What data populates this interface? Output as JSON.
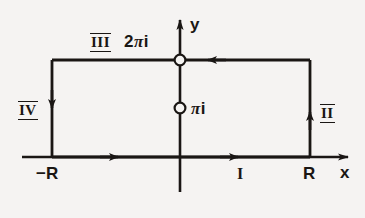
{
  "figure": {
    "background_color": "#f5f3f2",
    "ink_color": "#1a1614",
    "axes": {
      "x_label": "x",
      "y_label": "y",
      "origin_px": [
        180,
        157
      ],
      "x_axis_span_px": [
        22,
        352
      ],
      "y_axis_span_px": [
        16,
        192
      ]
    },
    "contour": {
      "shape": "rectangle",
      "corners_px": {
        "top_left": [
          52,
          60
        ],
        "top_right": [
          310,
          60
        ],
        "bottom_right": [
          310,
          157
        ],
        "bottom_left": [
          52,
          157
        ]
      },
      "orientation": "counterclockwise"
    },
    "segment_labels": [
      {
        "name": "segment-I",
        "text": "I",
        "style": "plain",
        "left_px": 237,
        "top_px": 166
      },
      {
        "name": "segment-II",
        "text": "II",
        "style": "barred",
        "left_px": 320,
        "top_px": 104
      },
      {
        "name": "segment-III",
        "text": "III",
        "style": "barred",
        "left_px": 90,
        "top_px": 33
      },
      {
        "name": "segment-IV",
        "text": "IV",
        "style": "barred",
        "left_px": 18,
        "top_px": 101
      }
    ],
    "points": [
      {
        "name": "point-two-pi-i",
        "label_prefix": "2",
        "label_pi": "π",
        "label_suffix": "i",
        "marker": "open-circle",
        "position_px": [
          180,
          60
        ],
        "label_left_px": 124,
        "label_top_px": 33
      },
      {
        "name": "point-pi-i",
        "label_prefix": "",
        "label_pi": "π",
        "label_suffix": "i",
        "marker": "open-circle",
        "position_px": [
          180,
          108
        ],
        "label_left_px": 191,
        "label_top_px": 100
      }
    ],
    "axis_ticks": [
      {
        "name": "tick-minus-R",
        "text": "−R",
        "left_px": 36,
        "top_px": 165
      },
      {
        "name": "tick-R",
        "text": "R",
        "left_px": 303,
        "top_px": 165
      }
    ],
    "axis_name_labels": [
      {
        "name": "axis-label-x",
        "text": "x",
        "left_px": 340,
        "top_px": 164
      },
      {
        "name": "axis-label-y",
        "text": "y",
        "left_px": 190,
        "top_px": 16
      }
    ],
    "direction_arrows": [
      {
        "name": "arrow-bottom-left",
        "direction": "right",
        "at_px": [
          118,
          157
        ]
      },
      {
        "name": "arrow-bottom-right",
        "direction": "right",
        "at_px": [
          238,
          157
        ]
      },
      {
        "name": "arrow-right-edge",
        "direction": "up",
        "at_px": [
          310,
          112
        ]
      },
      {
        "name": "arrow-top-edge",
        "direction": "left",
        "at_px": [
          208,
          60
        ]
      },
      {
        "name": "arrow-left-edge",
        "direction": "down",
        "at_px": [
          52,
          108
        ]
      },
      {
        "name": "arrow-x-axis-tip",
        "direction": "right",
        "at_px": [
          352,
          157
        ]
      },
      {
        "name": "arrow-y-axis-tip",
        "direction": "up",
        "at_px": [
          180,
          16
        ]
      }
    ]
  }
}
